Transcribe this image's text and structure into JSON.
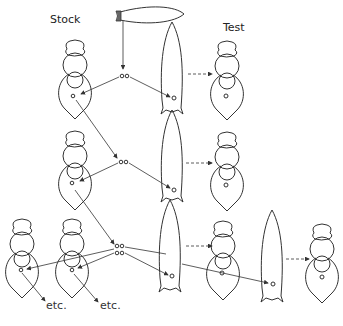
{
  "labels": {
    "stock": "Stock",
    "test": "Test",
    "etc_1": "etc.",
    "etc_2": "etc."
  },
  "colors": {
    "line": "#333333",
    "background": "#ffffff"
  },
  "diagram": {
    "rows": 3,
    "node_types": [
      "stock-host",
      "donor-worm",
      "cell-pair",
      "elongated-test-host",
      "test-result"
    ]
  }
}
